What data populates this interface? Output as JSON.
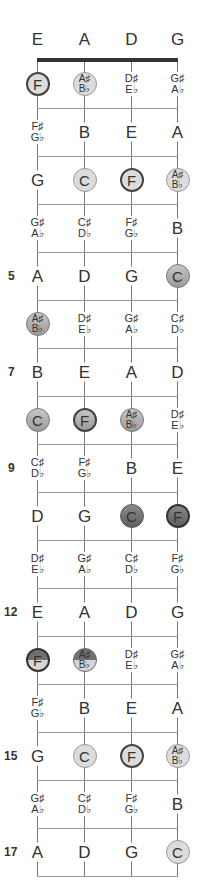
{
  "strings": [
    "E",
    "A",
    "D",
    "G"
  ],
  "string_x": [
    37,
    84,
    131,
    177
  ],
  "nut_y": 60,
  "fret_spacing": 48,
  "fret_count": 17,
  "fret_numbers": [
    {
      "fret": 5,
      "label": "5"
    },
    {
      "fret": 7,
      "label": "7"
    },
    {
      "fret": 9,
      "label": "9"
    },
    {
      "fret": 12,
      "label": "12"
    },
    {
      "fret": 15,
      "label": "15"
    },
    {
      "fret": 17,
      "label": "17"
    }
  ],
  "highlight_colors": {
    "light": "#dcdcdc",
    "mid": "#b0b0b0",
    "dark": "#6e6e6e",
    "outline_bold": "#444444"
  },
  "frets": [
    {
      "fret": 1,
      "notes": [
        {
          "top": "F",
          "style": "light-bold"
        },
        {
          "top": "A♯",
          "bottom": "B♭",
          "style": "light"
        },
        {
          "top": "D♯",
          "bottom": "E♭",
          "style": "none"
        },
        {
          "top": "G♯",
          "bottom": "A♭",
          "style": "none"
        }
      ]
    },
    {
      "fret": 2,
      "notes": [
        {
          "top": "F♯",
          "bottom": "G♭",
          "style": "none"
        },
        {
          "top": "B",
          "style": "none"
        },
        {
          "top": "E",
          "style": "none"
        },
        {
          "top": "A",
          "style": "none"
        }
      ]
    },
    {
      "fret": 3,
      "notes": [
        {
          "top": "G",
          "style": "none"
        },
        {
          "top": "C",
          "style": "light"
        },
        {
          "top": "F",
          "style": "light-bold"
        },
        {
          "top": "A♯",
          "bottom": "B♭",
          "style": "light"
        }
      ]
    },
    {
      "fret": 4,
      "notes": [
        {
          "top": "G♯",
          "bottom": "A♭",
          "style": "none"
        },
        {
          "top": "C♯",
          "bottom": "D♭",
          "style": "none"
        },
        {
          "top": "F♯",
          "bottom": "G♭",
          "style": "none"
        },
        {
          "top": "B",
          "style": "none"
        }
      ]
    },
    {
      "fret": 5,
      "notes": [
        {
          "top": "A",
          "style": "none"
        },
        {
          "top": "D",
          "style": "none"
        },
        {
          "top": "G",
          "style": "none"
        },
        {
          "top": "C",
          "style": "mid"
        }
      ]
    },
    {
      "fret": 6,
      "notes": [
        {
          "top": "A♯",
          "bottom": "B♭",
          "style": "mid"
        },
        {
          "top": "D♯",
          "bottom": "E♭",
          "style": "none"
        },
        {
          "top": "G♯",
          "bottom": "A♭",
          "style": "none"
        },
        {
          "top": "C♯",
          "bottom": "D♭",
          "style": "none"
        }
      ]
    },
    {
      "fret": 7,
      "notes": [
        {
          "top": "B",
          "style": "none"
        },
        {
          "top": "E",
          "style": "none"
        },
        {
          "top": "A",
          "style": "none"
        },
        {
          "top": "D",
          "style": "none"
        }
      ]
    },
    {
      "fret": 8,
      "notes": [
        {
          "top": "C",
          "style": "mid"
        },
        {
          "top": "F",
          "style": "mid-bold"
        },
        {
          "top": "A♯",
          "bottom": "B♭",
          "style": "mid"
        },
        {
          "top": "D♯",
          "bottom": "E♭",
          "style": "none"
        }
      ]
    },
    {
      "fret": 9,
      "notes": [
        {
          "top": "C♯",
          "bottom": "D♭",
          "style": "none"
        },
        {
          "top": "F♯",
          "bottom": "G♭",
          "style": "none"
        },
        {
          "top": "B",
          "style": "none"
        },
        {
          "top": "E",
          "style": "none"
        }
      ]
    },
    {
      "fret": 10,
      "notes": [
        {
          "top": "D",
          "style": "none"
        },
        {
          "top": "G",
          "style": "none"
        },
        {
          "top": "C",
          "style": "dark"
        },
        {
          "top": "F",
          "style": "dark-bold"
        }
      ]
    },
    {
      "fret": 11,
      "notes": [
        {
          "top": "D♯",
          "bottom": "E♭",
          "style": "none"
        },
        {
          "top": "G♯",
          "bottom": "A♭",
          "style": "none"
        },
        {
          "top": "C♯",
          "bottom": "D♭",
          "style": "none"
        },
        {
          "top": "F♯",
          "bottom": "G♭",
          "style": "none"
        }
      ]
    },
    {
      "fret": 12,
      "notes": [
        {
          "top": "E",
          "style": "none"
        },
        {
          "top": "A",
          "style": "none"
        },
        {
          "top": "D",
          "style": "none"
        },
        {
          "top": "G",
          "style": "none"
        }
      ]
    },
    {
      "fret": 13,
      "notes": [
        {
          "top": "F",
          "style": "split-bold"
        },
        {
          "top": "A♯",
          "bottom": "B♭",
          "style": "split"
        },
        {
          "top": "D♯",
          "bottom": "E♭",
          "style": "none"
        },
        {
          "top": "G♯",
          "bottom": "A♭",
          "style": "none"
        }
      ]
    },
    {
      "fret": 14,
      "notes": [
        {
          "top": "F♯",
          "bottom": "G♭",
          "style": "none"
        },
        {
          "top": "B",
          "style": "none"
        },
        {
          "top": "E",
          "style": "none"
        },
        {
          "top": "A",
          "style": "none"
        }
      ]
    },
    {
      "fret": 15,
      "notes": [
        {
          "top": "G",
          "style": "none"
        },
        {
          "top": "C",
          "style": "light"
        },
        {
          "top": "F",
          "style": "light-bold"
        },
        {
          "top": "A♯",
          "bottom": "B♭",
          "style": "light"
        }
      ]
    },
    {
      "fret": 16,
      "notes": [
        {
          "top": "G♯",
          "bottom": "A♭",
          "style": "none"
        },
        {
          "top": "C♯",
          "bottom": "D♭",
          "style": "none"
        },
        {
          "top": "F♯",
          "bottom": "G♭",
          "style": "none"
        },
        {
          "top": "B",
          "style": "none"
        }
      ]
    },
    {
      "fret": 17,
      "notes": [
        {
          "top": "A",
          "style": "none"
        },
        {
          "top": "D",
          "style": "none"
        },
        {
          "top": "G",
          "style": "none"
        },
        {
          "top": "C",
          "style": "light"
        }
      ]
    }
  ]
}
